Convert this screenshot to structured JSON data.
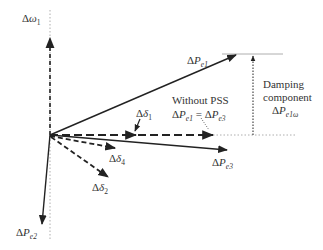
{
  "diagram": {
    "type": "phasor-diagram",
    "colors": {
      "stroke": "#222222",
      "thin": "#999999",
      "text": "#333333",
      "background": "#ffffff"
    },
    "labels": {
      "d_omega1": {
        "delta": "Δ",
        "sym": "ω",
        "sub": "1"
      },
      "d_pe1": {
        "delta": "Δ",
        "sym": "P",
        "sub": "e1"
      },
      "d_delta1": {
        "delta": "Δ",
        "sym": "δ",
        "sub": "1"
      },
      "d_delta4": {
        "delta": "Δ",
        "sym": "δ",
        "sub": "4"
      },
      "d_delta2": {
        "delta": "Δ",
        "sym": "δ",
        "sub": "2"
      },
      "d_pe2": {
        "delta": "Δ",
        "sym": "P",
        "sub": "e2"
      },
      "d_pe3": {
        "delta": "Δ",
        "sym": "P",
        "sub": "e3"
      },
      "without_pss": {
        "line1": "Without PSS",
        "eq_lhs": {
          "delta": "Δ",
          "sym": "P",
          "sub": "e1"
        },
        "eq_sign": " = ",
        "eq_rhs": {
          "delta": "Δ",
          "sym": "P",
          "sub": "e3"
        }
      },
      "damping": {
        "line1": "Damping",
        "line2": "component",
        "sym": {
          "delta": "Δ",
          "sym": "P",
          "sub": "e1ω"
        }
      }
    },
    "vectors": [
      {
        "name": "d_omega1",
        "style": "dashed",
        "from": [
          50,
          135
        ],
        "to": [
          50,
          37
        ]
      },
      {
        "name": "d_pe1",
        "style": "solid",
        "from": [
          50,
          135
        ],
        "to": [
          237,
          54
        ]
      },
      {
        "name": "d_delta1_axis",
        "style": "dashed",
        "from": [
          50,
          135
        ],
        "to": [
          213,
          135
        ]
      },
      {
        "name": "d_pe3",
        "style": "solid",
        "from": [
          50,
          135
        ],
        "to": [
          228,
          150
        ]
      },
      {
        "name": "d_delta4",
        "style": "dashed",
        "from": [
          50,
          135
        ],
        "to": [
          116,
          148
        ]
      },
      {
        "name": "d_delta2",
        "style": "dashed",
        "from": [
          50,
          135
        ],
        "to": [
          109,
          178
        ]
      },
      {
        "name": "d_pe2",
        "style": "solid",
        "from": [
          50,
          135
        ],
        "to": [
          42,
          225
        ]
      },
      {
        "name": "damping_component",
        "style": "dotted",
        "from": [
          253,
          135
        ],
        "to": [
          253,
          54
        ]
      }
    ]
  }
}
